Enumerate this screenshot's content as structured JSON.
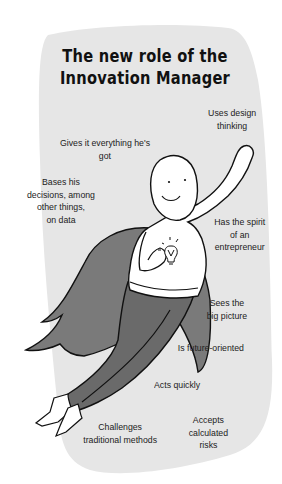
{
  "title": {
    "line1": "The new role of the",
    "line2": "Innovation Manager"
  },
  "traits": [
    {
      "id": "design-thinking",
      "lines": [
        "Uses design",
        "thinking"
      ]
    },
    {
      "id": "gives-everything",
      "lines": [
        "Gives it everything he's",
        "got"
      ]
    },
    {
      "id": "data-decisions",
      "lines": [
        "Bases his",
        "decisions, among",
        "other things,",
        "on data"
      ]
    },
    {
      "id": "entrepreneur",
      "lines": [
        "Has the spirit",
        "of an",
        "entrepreneur"
      ]
    },
    {
      "id": "big-picture",
      "lines": [
        "Sees the",
        "big picture"
      ]
    },
    {
      "id": "future-oriented",
      "lines": [
        "Is future-oriented"
      ]
    },
    {
      "id": "acts-quickly",
      "lines": [
        "Acts quickly"
      ]
    },
    {
      "id": "challenges-methods",
      "lines": [
        "Challenges",
        "traditional methods"
      ]
    },
    {
      "id": "calculated-risks",
      "lines": [
        "Accepts",
        "calculated",
        "risks"
      ]
    }
  ],
  "illustration": {
    "subject": "superhero-innovation-manager",
    "icons": [
      "lightbulb-icon",
      "cape",
      "raised-fist"
    ]
  },
  "colors": {
    "background": "#ffffff",
    "blob": "#e6e6e6",
    "cape": "#7a7a7a",
    "pants": "#6a6a6a",
    "outline": "#111111",
    "body": "#ffffff",
    "text": "#222222"
  }
}
